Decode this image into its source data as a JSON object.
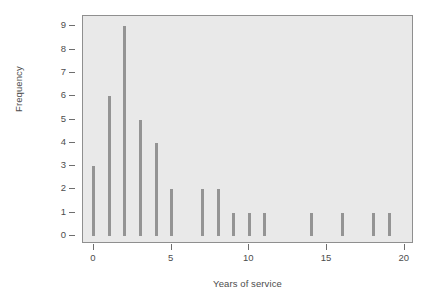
{
  "chart_data": {
    "type": "bar",
    "title": "",
    "subtitle": "",
    "xlabel": "Years of service",
    "ylabel": "Frequency",
    "x": [
      0,
      1,
      2,
      3,
      4,
      5,
      6,
      7,
      8,
      9,
      10,
      11,
      12,
      13,
      14,
      15,
      16,
      17,
      18,
      19
    ],
    "values": [
      3,
      6,
      9,
      5,
      4,
      2,
      0,
      2,
      2,
      1,
      1,
      1,
      0,
      0,
      1,
      0,
      1,
      0,
      1,
      1
    ],
    "categories": [
      "0",
      "1",
      "2",
      "3",
      "4",
      "5",
      "6",
      "7",
      "8",
      "9",
      "10",
      "11",
      "12",
      "13",
      "14",
      "15",
      "16",
      "17",
      "18",
      "19"
    ],
    "xlim": [
      -0.7,
      20.6
    ],
    "ylim": [
      -0.35,
      9.45
    ],
    "xticks": [
      0,
      5,
      10,
      15,
      20
    ],
    "xtick_labels": [
      "0",
      "5",
      "10",
      "15",
      "20"
    ],
    "yticks": [
      0,
      1,
      2,
      3,
      4,
      5,
      6,
      7,
      8,
      9
    ],
    "ytick_labels": [
      "0",
      "1",
      "2",
      "3",
      "4",
      "5",
      "6",
      "7",
      "8",
      "9"
    ],
    "grid": false,
    "legend": null,
    "annotations": [],
    "colors": {
      "bar": "#949494",
      "panel_background": "#e9e9e9",
      "panel_border": "#8f8f8f",
      "axis": "#6e6e6e",
      "text": "#4d4d4d",
      "canvas": "#ffffff"
    }
  }
}
